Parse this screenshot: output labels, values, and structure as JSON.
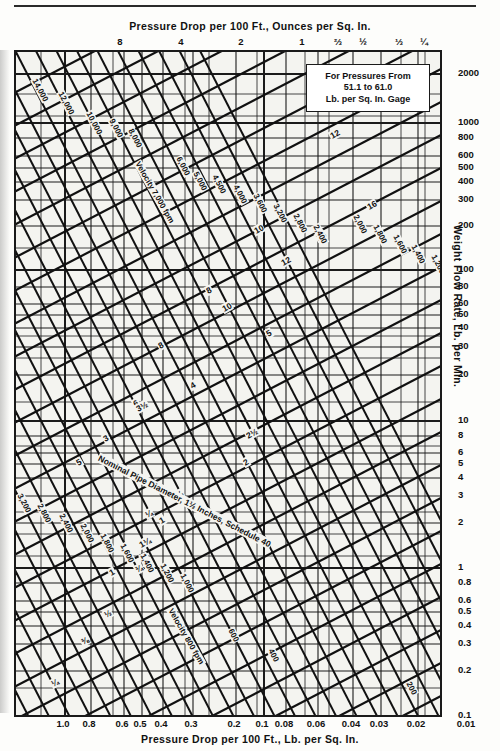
{
  "chart_data": {
    "type": "line",
    "xlabel": "Pressure Drop per 100 Ft., Lb. per Sq. In.",
    "xlabel_top": "Pressure Drop per 100 Ft., Ounces per Sq. In.",
    "ylabel": "Weight Flow Rate, Lb. per Min.",
    "x_scale": "log",
    "y_scale": "log",
    "grid": true,
    "legend_position": "none",
    "xlim": [
      1.0,
      0.01
    ],
    "ylim": [
      0.1,
      3000
    ],
    "x_ticks_bottom": [
      "1.0",
      "0.8",
      "0.6",
      "0.5",
      "0.4",
      "0.3",
      "0.2",
      "0.1",
      "0.08",
      "0.06",
      "0.04",
      "0.03",
      "0.02",
      "0.01"
    ],
    "x_ticks_top": [
      "8",
      "4",
      "2",
      "1",
      "⅔",
      "½",
      "⅓",
      "¼"
    ],
    "y_ticks": [
      "2000",
      "1000",
      "800",
      "600",
      "500",
      "400",
      "300",
      "200",
      "100",
      "80",
      "60",
      "50",
      "40",
      "30",
      "20",
      "10",
      "8",
      "6",
      "5",
      "4",
      "3",
      "2",
      "1",
      "0.8",
      "0.6",
      "0.5",
      "0.4",
      "0.3",
      "0.2",
      "0.1"
    ],
    "series": [
      {
        "name": "Nominal Pipe Diameter, Schedule 40 (inches)",
        "kind": "diagonal-family-up",
        "values": [
          "16",
          "14",
          "12",
          "10",
          "8",
          "6",
          "5",
          "4",
          "3½",
          "3",
          "2½",
          "2",
          "1½",
          "1¼",
          "1",
          "¾",
          "½",
          "⅜",
          "¼"
        ]
      },
      {
        "name": "Velocity (feet per minute)",
        "kind": "diagonal-family-down",
        "values": [
          "14,000",
          "12,000",
          "10,000",
          "9,000",
          "8,000",
          "7,000",
          "6,000",
          "5,000",
          "4,500",
          "4,000",
          "3,600",
          "3,200",
          "2,800",
          "2,400",
          "2,000",
          "1,800",
          "1,600",
          "1,400",
          "1,200",
          "1,000",
          "800",
          "600",
          "400",
          "200"
        ]
      }
    ],
    "annotations": [
      "Nominal Pipe Diameter, 1½ Inches, Schedule 40",
      "Velocity 7,000 fpm",
      "Velocity 800 fpm",
      "For Pressures From 51.1 to 61.0 Lb. per Sq. In. Gage"
    ]
  },
  "top_axis": {
    "title": "Pressure Drop per 100 Ft., Ounces per Sq. In.",
    "ticks": [
      {
        "label": "8",
        "x": 120
      },
      {
        "label": "4",
        "x": 181
      },
      {
        "label": "2",
        "x": 241
      },
      {
        "label": "1",
        "x": 302
      },
      {
        "label": "⅔",
        "x": 338
      },
      {
        "label": "½",
        "x": 363
      },
      {
        "label": "⅓",
        "x": 399
      },
      {
        "label": "¼",
        "x": 424
      }
    ]
  },
  "bottom_axis": {
    "title": "Pressure Drop per 100 Ft., Lb. per Sq. In.",
    "ticks": [
      {
        "label": "1.0",
        "x": 63
      },
      {
        "label": "0.8",
        "x": 89
      },
      {
        "label": "0.6",
        "x": 122
      },
      {
        "label": "0.5",
        "x": 140
      },
      {
        "label": "0.4",
        "x": 161
      },
      {
        "label": "0.3",
        "x": 191
      },
      {
        "label": "0.2",
        "x": 234
      },
      {
        "label": "0.1",
        "x": 262
      },
      {
        "label": "0.08",
        "x": 284
      },
      {
        "label": "0.06",
        "x": 316
      },
      {
        "label": "0.04",
        "x": 351
      },
      {
        "label": "0.03",
        "x": 379
      },
      {
        "label": "0.02",
        "x": 416
      },
      {
        "label": "0.01",
        "x": 466
      }
    ]
  },
  "y_axis": {
    "title": "Weight Flow Rate, Lb. per Min.",
    "ticks": [
      {
        "label": "2000",
        "y": 72
      },
      {
        "label": "1000",
        "y": 121
      },
      {
        "label": "800",
        "y": 136
      },
      {
        "label": "600",
        "y": 154
      },
      {
        "label": "500",
        "y": 166
      },
      {
        "label": "400",
        "y": 180
      },
      {
        "label": "300",
        "y": 198
      },
      {
        "label": "200",
        "y": 224
      },
      {
        "label": "100",
        "y": 268
      },
      {
        "label": "80",
        "y": 285
      },
      {
        "label": "60",
        "y": 302
      },
      {
        "label": "50",
        "y": 313
      },
      {
        "label": "40",
        "y": 326
      },
      {
        "label": "30",
        "y": 345
      },
      {
        "label": "20",
        "y": 373
      },
      {
        "label": "10",
        "y": 419
      },
      {
        "label": "8",
        "y": 434
      },
      {
        "label": "6",
        "y": 451
      },
      {
        "label": "5",
        "y": 462
      },
      {
        "label": "4",
        "y": 476
      },
      {
        "label": "3",
        "y": 494
      },
      {
        "label": "2",
        "y": 521
      },
      {
        "label": "1",
        "y": 566
      },
      {
        "label": "0.8",
        "y": 581
      },
      {
        "label": "0.6",
        "y": 599
      },
      {
        "label": "0.5",
        "y": 610
      },
      {
        "label": "0.4",
        "y": 624
      },
      {
        "label": "0.3",
        "y": 642
      },
      {
        "label": "0.2",
        "y": 669
      },
      {
        "label": "0.1",
        "y": 714
      }
    ]
  },
  "callout": {
    "line1": "For Pressures From",
    "line2": "51.1 to 61.0",
    "line3": "Lb. per Sq. In. Gage"
  },
  "pipe_labels": [
    {
      "t": "16",
      "x": 378,
      "y": 18,
      "r": -30
    },
    {
      "t": "14",
      "x": 343,
      "y": 40,
      "r": -30
    },
    {
      "t": "12",
      "x": 314,
      "y": 80,
      "r": -30
    },
    {
      "t": "10",
      "x": 238,
      "y": 175,
      "r": -30
    },
    {
      "t": "8",
      "x": 190,
      "y": 235,
      "r": -30
    },
    {
      "t": "6",
      "x": 117,
      "y": 348,
      "r": -30
    },
    {
      "t": "5",
      "x": 60,
      "y": 407,
      "r": -30
    },
    {
      "t": "16",
      "x": 351,
      "y": 151,
      "r": -30
    },
    {
      "t": "14",
      "x": 300,
      "y": 182,
      "r": -30
    },
    {
      "t": "12",
      "x": 265,
      "y": 207,
      "r": -30
    },
    {
      "t": "10",
      "x": 206,
      "y": 253,
      "r": -30
    },
    {
      "t": "8",
      "x": 142,
      "y": 290,
      "r": -30
    },
    {
      "t": "5",
      "x": 250,
      "y": 278,
      "r": -30
    },
    {
      "t": "4",
      "x": 174,
      "y": 330,
      "r": -30
    },
    {
      "t": "3½",
      "x": 120,
      "y": 353,
      "r": -30
    },
    {
      "t": "3",
      "x": 87,
      "y": 383,
      "r": -30
    },
    {
      "t": "2½",
      "x": 230,
      "y": 380,
      "r": -30
    },
    {
      "t": "2",
      "x": 227,
      "y": 407,
      "r": -30
    },
    {
      "t": "1¼",
      "x": 123,
      "y": 489,
      "r": -30
    },
    {
      "t": "1",
      "x": 93,
      "y": 517,
      "r": -30
    },
    {
      "t": "¼",
      "x": 129,
      "y": 459,
      "r": -30
    },
    {
      "t": "1¼",
      "x": 155,
      "y": 442,
      "r": -30
    },
    {
      "t": "1",
      "x": 143,
      "y": 465,
      "r": -30
    },
    {
      "t": "¾",
      "x": 119,
      "y": 514,
      "r": -30
    },
    {
      "t": "½",
      "x": 88,
      "y": 559,
      "r": -30
    },
    {
      "t": "⅜",
      "x": 65,
      "y": 586,
      "r": -30
    },
    {
      "t": "¼",
      "x": 35,
      "y": 628,
      "r": -30
    }
  ],
  "velocity_labels": [
    {
      "t": "14,000",
      "x": 18,
      "y": 22,
      "r": 62
    },
    {
      "t": "12,000",
      "x": 44,
      "y": 35,
      "r": 62
    },
    {
      "t": "10,000",
      "x": 72,
      "y": 55,
      "r": 62
    },
    {
      "t": "9,000",
      "x": 95,
      "y": 62,
      "r": 62
    },
    {
      "t": "8,000",
      "x": 114,
      "y": 72,
      "r": 62
    },
    {
      "t": "Velocity 7,000 fpm",
      "x": 121,
      "y": 105,
      "r": 60
    },
    {
      "t": "6,000",
      "x": 162,
      "y": 100,
      "r": 62
    },
    {
      "t": "5,000",
      "x": 179,
      "y": 115,
      "r": 62
    },
    {
      "t": "4,500",
      "x": 198,
      "y": 118,
      "r": 62
    },
    {
      "t": "4,000",
      "x": 219,
      "y": 128,
      "r": 62
    },
    {
      "t": "3,600",
      "x": 239,
      "y": 137,
      "r": 62
    },
    {
      "t": "3,200",
      "x": 259,
      "y": 147,
      "r": 62
    },
    {
      "t": "2,800",
      "x": 279,
      "y": 157,
      "r": 62
    },
    {
      "t": "2,400",
      "x": 299,
      "y": 168,
      "r": 62
    },
    {
      "t": "2,000",
      "x": 339,
      "y": 158,
      "r": 62
    },
    {
      "t": "1,800",
      "x": 359,
      "y": 168,
      "r": 62
    },
    {
      "t": "1,600",
      "x": 379,
      "y": 178,
      "r": 62
    },
    {
      "t": "1,400",
      "x": 397,
      "y": 188,
      "r": 62
    },
    {
      "t": "1,200",
      "x": 417,
      "y": 198,
      "r": 62
    },
    {
      "t": "3,200",
      "x": 3,
      "y": 437,
      "r": 62
    },
    {
      "t": "2,800",
      "x": 23,
      "y": 447,
      "r": 62
    },
    {
      "t": "2,400",
      "x": 45,
      "y": 457,
      "r": 62
    },
    {
      "t": "2,000",
      "x": 66,
      "y": 467,
      "r": 62
    },
    {
      "t": "1,800",
      "x": 86,
      "y": 477,
      "r": 62
    },
    {
      "t": "1,600",
      "x": 106,
      "y": 487,
      "r": 62
    },
    {
      "t": "1,400",
      "x": 126,
      "y": 497,
      "r": 62
    },
    {
      "t": "1,200",
      "x": 146,
      "y": 507,
      "r": 62
    },
    {
      "t": "1,000",
      "x": 166,
      "y": 517,
      "r": 62
    },
    {
      "t": "Velocity 800 fpm",
      "x": 154,
      "y": 552,
      "r": 60
    },
    {
      "t": "600",
      "x": 214,
      "y": 572,
      "r": 62
    },
    {
      "t": "400",
      "x": 254,
      "y": 592,
      "r": 62
    },
    {
      "t": "200",
      "x": 392,
      "y": 625,
      "r": 62
    }
  ],
  "diagonal_annotation": {
    "text": "Nominal Pipe Diameter, 1½ Inches, Schedule 40",
    "x": 82,
    "y": 400,
    "r": 27
  }
}
